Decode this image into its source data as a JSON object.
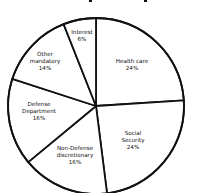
{
  "chart_data": {
    "type": "pie",
    "title": "",
    "start_angle_deg": 0,
    "direction": "clockwise",
    "categories": [
      "Health care",
      "Social Security",
      "Non-Defense discretionary",
      "Defense Department",
      "Other mandatory",
      "Interest"
    ],
    "values": [
      24,
      24,
      16,
      16,
      14,
      6
    ],
    "value_labels": [
      "24%",
      "24%",
      "16%",
      "16%",
      "14%",
      "6%"
    ],
    "colors": {
      "fill": "#ffffff",
      "stroke": "#111111",
      "text": "#111111"
    },
    "legend": "none",
    "slices": [
      {
        "name": "Health care",
        "lines": [
          "Health care"
        ],
        "pct": "24%",
        "value": 24
      },
      {
        "name": "Social Security",
        "lines": [
          "Social",
          "Security"
        ],
        "pct": "24%",
        "value": 24
      },
      {
        "name": "Non-Defense discretionary",
        "lines": [
          "Non-Defense",
          "discretionary"
        ],
        "pct": "16%",
        "value": 16
      },
      {
        "name": "Defense Department",
        "lines": [
          "Defense",
          "Department"
        ],
        "pct": "16%",
        "value": 16
      },
      {
        "name": "Other mandatory",
        "lines": [
          "Other",
          "mandatory"
        ],
        "pct": "14%",
        "value": 14
      },
      {
        "name": "Interest",
        "lines": [
          "Interest"
        ],
        "pct": "6%",
        "value": 6
      }
    ]
  }
}
